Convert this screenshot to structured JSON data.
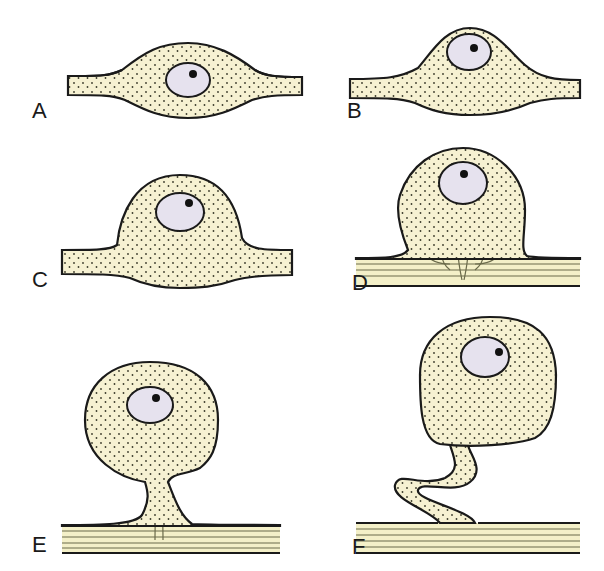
{
  "figure": {
    "panels": [
      {
        "id": "A",
        "label": "A"
      },
      {
        "id": "B",
        "label": "B"
      },
      {
        "id": "C",
        "label": "C"
      },
      {
        "id": "D",
        "label": "D"
      },
      {
        "id": "E",
        "label": "E"
      },
      {
        "id": "F",
        "label": "F"
      }
    ],
    "colors": {
      "cytoplasm": "#f6f1d2",
      "stipple": "#3a3a2a",
      "nucleus": "#e6e2ee",
      "outline": "#1a1a1a",
      "fiber": "#f4f0c8"
    }
  }
}
